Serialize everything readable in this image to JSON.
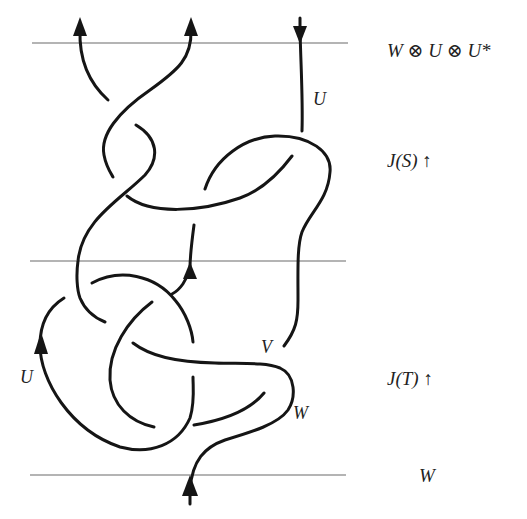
{
  "diagram": {
    "type": "tangle diagram",
    "reference_lines": [
      {
        "name": "top-boundary",
        "y": 43
      },
      {
        "name": "middle-boundary",
        "y": 261
      },
      {
        "name": "bottom-boundary",
        "y": 475
      }
    ],
    "side_labels": {
      "top": "W ⊗ U ⊗ U*",
      "upper_tangle": "J(S) ↑",
      "lower_tangle": "J(T) ↑",
      "bottom": "W"
    },
    "strand_labels": {
      "upper_right_strand": "U",
      "left_loop": "U",
      "crossing_v": "V",
      "crossing_w": "W"
    },
    "arrows": [
      {
        "name": "top-left-endpoint",
        "direction": "up"
      },
      {
        "name": "top-middle-endpoint",
        "direction": "up"
      },
      {
        "name": "top-right-endpoint",
        "direction": "down"
      },
      {
        "name": "middle-inner-strand",
        "direction": "up"
      },
      {
        "name": "left-loop",
        "direction": "up"
      },
      {
        "name": "bottom-endpoint",
        "direction": "up"
      }
    ],
    "colors": {
      "strand": "#151515",
      "reference_line": "#6a6a6a",
      "background": "#ffffff"
    }
  }
}
